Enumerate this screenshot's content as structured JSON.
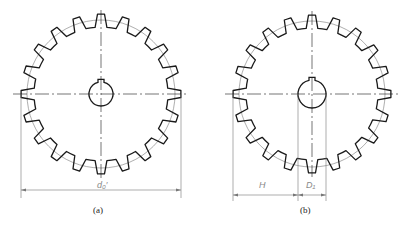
{
  "figure_a": {
    "caption": "(a)",
    "dimension_label": "d₀′",
    "teeth": 20,
    "center": [
      101,
      94
    ],
    "outer_radius": 80,
    "root_radius": 67,
    "pitch_radius": 74,
    "bore_radius": 12
  },
  "figure_b": {
    "caption": "(b)",
    "dimension_labels": {
      "H": "H",
      "D1": "D₁"
    },
    "teeth": 20,
    "center": [
      312,
      94
    ],
    "outer_radius": 79,
    "root_radius": 66,
    "pitch_radius": 73,
    "bore_radius": 14
  },
  "colors": {
    "outline": "#1a1a1a",
    "thin": "#777777",
    "label": "#888888"
  }
}
